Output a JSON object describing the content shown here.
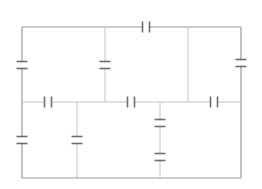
{
  "diagram": {
    "type": "circuit",
    "colors": {
      "wire": "#9a9a9a",
      "wire_light": "#c4c4c4",
      "plate": "#6e6e6e",
      "background": "#ffffff"
    },
    "nodes": {
      "top_y": 27,
      "mid_y": 102,
      "bottom_y": 178,
      "left_x": 22,
      "branch1_x": 105,
      "branch2_x": 188,
      "right_x": 241,
      "lower1_x": 77,
      "lower2_x": 160
    },
    "capacitors": [
      {
        "id": "C-top",
        "orientation": "horizontal",
        "x": 146,
        "y": 27
      },
      {
        "id": "C-left-upper",
        "orientation": "vertical",
        "x": 22,
        "y": 65
      },
      {
        "id": "C-branch1",
        "orientation": "vertical",
        "x": 105,
        "y": 65
      },
      {
        "id": "C-right-upper",
        "orientation": "vertical",
        "x": 241,
        "y": 63
      },
      {
        "id": "C-mid-left",
        "orientation": "horizontal",
        "x": 48,
        "y": 102
      },
      {
        "id": "C-mid-center",
        "orientation": "horizontal",
        "x": 131,
        "y": 102
      },
      {
        "id": "C-mid-right",
        "orientation": "horizontal",
        "x": 214,
        "y": 102
      },
      {
        "id": "C-left-lower",
        "orientation": "vertical",
        "x": 22,
        "y": 140
      },
      {
        "id": "C-lower1",
        "orientation": "vertical",
        "x": 77,
        "y": 140
      },
      {
        "id": "C-lower2-a",
        "orientation": "vertical",
        "x": 160,
        "y": 123
      },
      {
        "id": "C-lower2-b",
        "orientation": "vertical",
        "x": 160,
        "y": 157
      }
    ]
  }
}
